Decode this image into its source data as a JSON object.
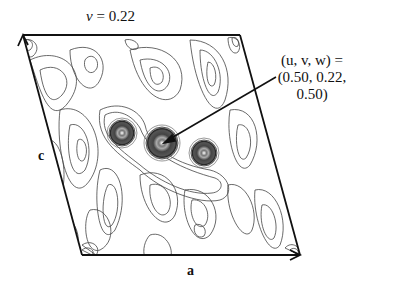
{
  "title": {
    "var": "v",
    "eq": " = 0.22"
  },
  "annotation": {
    "line1": "(u, v, w) =",
    "line2": "(0.50, 0.22, 0.50)"
  },
  "axes": {
    "a": "a",
    "c": "c"
  },
  "colors": {
    "line": "#111111",
    "contour": "#444444",
    "peak": "#333333"
  },
  "peaks": [
    {
      "x": 122,
      "y": 133,
      "r": 13
    },
    {
      "x": 162,
      "y": 143,
      "r": 16
    },
    {
      "x": 204,
      "y": 153,
      "r": 13
    }
  ]
}
